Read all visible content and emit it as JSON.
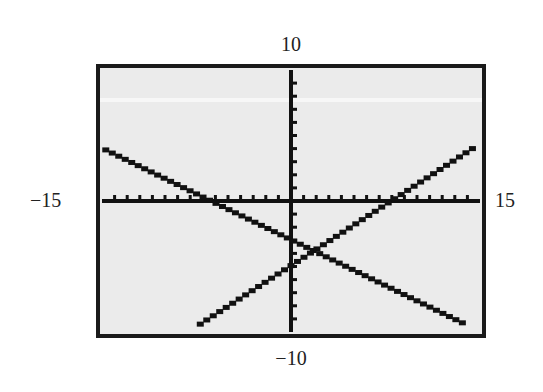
{
  "window": {
    "xmin": -15,
    "xmax": 15,
    "ymin": -10,
    "ymax": 10,
    "xscl": 1,
    "yscl": 1
  },
  "labels": {
    "ymax": "10",
    "ymin": "−10",
    "xmin": "−15",
    "xmax": "15"
  },
  "colors": {
    "screen_bg": "#ebebeb",
    "ink": "#111111",
    "frame": "#1a1a1a"
  },
  "chart_data": {
    "type": "line",
    "title": "",
    "xlabel": "",
    "ylabel": "",
    "xlim": [
      -15,
      15
    ],
    "ylim": [
      -10,
      10
    ],
    "grid": false,
    "axes": true,
    "tick_spacing": {
      "x": 1,
      "y": 1
    },
    "tick_labels": {
      "x_min": "−15",
      "x_max": "15",
      "y_min": "−10",
      "y_max": "10"
    },
    "series": [
      {
        "name": "decreasing line",
        "approx_equation": "y = -0.47x - 3",
        "x": [
          -14.7,
          0,
          1.7,
          13.6
        ],
        "y": [
          3.9,
          -3.0,
          -3.8,
          -9.3
        ]
      },
      {
        "name": "increasing line",
        "approx_equation": "y = 0.62x - 4.9",
        "x": [
          -7.2,
          0,
          1.7,
          14.4
        ],
        "y": [
          -9.4,
          -4.9,
          -3.8,
          4.0
        ]
      }
    ],
    "intersection": {
      "x": 1.7,
      "y": -3.8
    }
  }
}
